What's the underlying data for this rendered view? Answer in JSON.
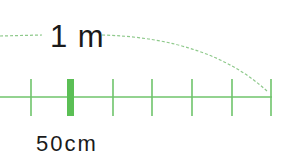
{
  "diagram": {
    "type": "scale-ruler",
    "top_label": "1 m",
    "bottom_label": "50cm",
    "colors": {
      "ruler": "#6fc46b",
      "highlight_tick": "#5bbf55",
      "dashed_arc": "#8ec98b",
      "text": "#1a1a1a",
      "background": "#ffffff"
    },
    "ticks_x": [
      31,
      70,
      113,
      152,
      192,
      232,
      271
    ],
    "highlight_tick_index": 1
  }
}
